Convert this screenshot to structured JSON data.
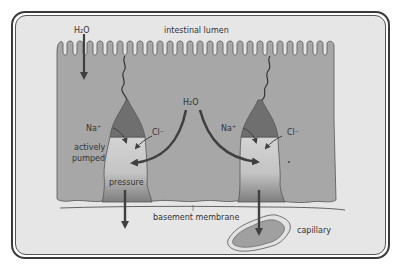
{
  "figure": {
    "labels": {
      "h2o_top": "H₂O",
      "h2o_center": "H₂O",
      "lumen": "intestinal lumen",
      "na_left": "Na⁺",
      "cl_left": "Cl⁻",
      "na_right": "Na⁺",
      "cl_right": "Cl⁻",
      "actively_line1": "actively",
      "actively_line2": "pumped",
      "pressure": "pressure",
      "basement_membrane": "basement membrane",
      "capillary": "capillary"
    },
    "colors": {
      "background": "#e6e6e6",
      "cell": "#a7a7a7",
      "cell_outline": "#555555",
      "junction_dark": "#6f6f6f",
      "intercellular_light": "#cdcdcd",
      "intercellular_dark": "#8a8a8a",
      "arrow": "#404040",
      "capillary_fill": "#a0a0a0",
      "text": "#333333",
      "frame": "#3a3a3a"
    }
  }
}
